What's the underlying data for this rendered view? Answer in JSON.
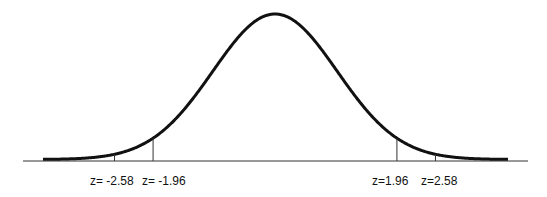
{
  "chart_data": {
    "type": "line",
    "title": "",
    "xlabel": "",
    "ylabel": "",
    "distribution": {
      "mean": 0,
      "sd": 1
    },
    "xlim": [
      -4,
      4
    ],
    "grid": false,
    "legend": null,
    "markers": [
      {
        "z": -2.58,
        "label": "z= -2.58"
      },
      {
        "z": -1.96,
        "label": "z= -1.96"
      },
      {
        "z": 1.96,
        "label": "z=1.96"
      },
      {
        "z": 2.58,
        "label": "z=2.58"
      }
    ],
    "colors": {
      "curve": "#111111",
      "axis": "#333333",
      "background": "#ffffff"
    }
  },
  "labels": {
    "m1": "z= -2.58",
    "m2": "z= -1.96",
    "m3": "z=1.96",
    "m4": "z=2.58"
  }
}
